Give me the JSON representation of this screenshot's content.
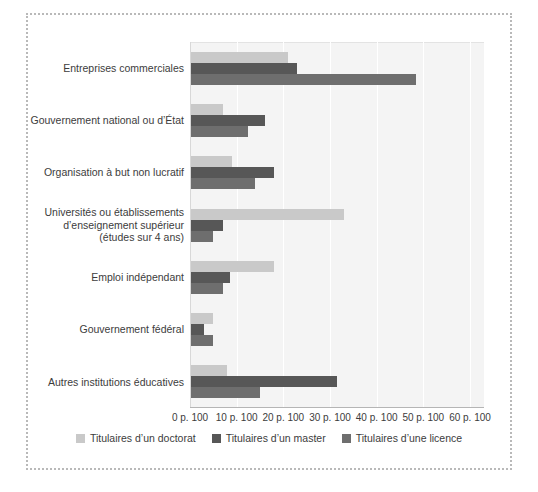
{
  "frame": {
    "style": "dotted-border"
  },
  "chart_data": {
    "type": "bar",
    "orientation": "horizontal",
    "title": "",
    "subtitle": "",
    "xlabel": "",
    "ylabel": "",
    "xlim": [
      0,
      63
    ],
    "xticks": [
      0,
      10,
      20,
      30,
      40,
      50,
      60
    ],
    "xtick_labels": [
      "0 p. 100",
      "10 p. 100",
      "20 p. 100",
      "30 p. 100",
      "40 p. 100",
      "50 p. 100",
      "60 p. 100"
    ],
    "grid": true,
    "grid_axis": "x",
    "legend_position": "bottom",
    "categories": [
      "Entreprises commerciales",
      "Gouvernement national ou d’État",
      "Organisation à but non lucratif",
      "Universités ou établissements\nd’enseignement supérieur\n(études sur 4 ans)",
      "Emploi indépendant",
      "Gouvernement fédéral",
      "Autres institutions éducatives"
    ],
    "series": [
      {
        "name": "Titulaires d’un doctorat",
        "color": "#c9c9c9",
        "values": [
          21,
          7,
          9,
          33,
          18,
          5,
          8
        ]
      },
      {
        "name": "Titulaires d’un master",
        "color": "#575757",
        "values": [
          23,
          16,
          18,
          7,
          8.5,
          3,
          31.5
        ]
      },
      {
        "name": "Titulaires d’une licence",
        "color": "#6e6e6e",
        "values": [
          48.5,
          12.5,
          14,
          5,
          7,
          5,
          15
        ]
      }
    ]
  }
}
